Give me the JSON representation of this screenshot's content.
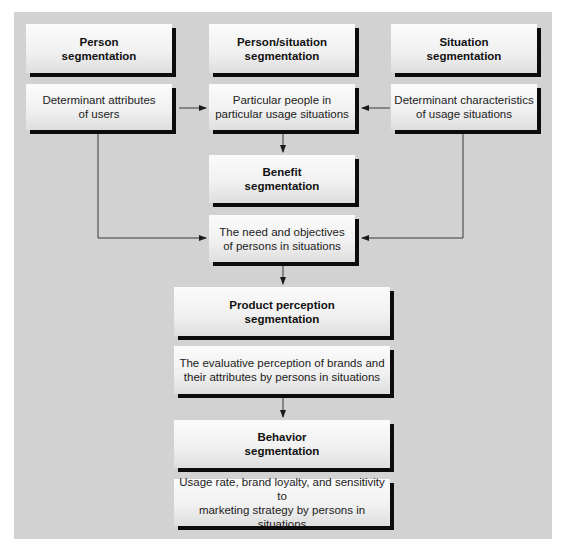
{
  "diagram": {
    "columns": {
      "person": {
        "title": "Person\nsegmentation",
        "description": "Determinant attributes\nof users"
      },
      "person_situation": {
        "title": "Person/situation\nsegmentation",
        "description": "Particular people in\nparticular usage situations"
      },
      "situation": {
        "title": "Situation\nsegmentation",
        "description": "Determinant characteristics\nof usage situations"
      }
    },
    "flow": [
      {
        "title": "Benefit\nsegmentation",
        "description": "The need and objectives\nof persons in situations"
      },
      {
        "title": "Product perception\nsegmentation",
        "description": "The evaluative perception of brands and\ntheir attributes by persons in situations"
      },
      {
        "title": "Behavior\nsegmentation",
        "description": "Usage rate, brand loyalty, and sensitivity to\nmarketing strategy by persons in situations"
      }
    ],
    "colors": {
      "panel_background": "#d2d2d2",
      "box_fill": "#f5f5f5",
      "box_shadow": "#0c0c0c",
      "connector": "#333333"
    }
  }
}
